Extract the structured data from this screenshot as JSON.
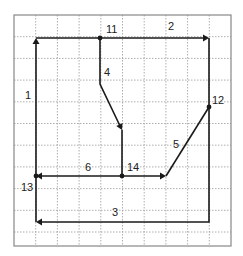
{
  "diagram": {
    "type": "grid-flow-diagram",
    "grid": {
      "x0": 14,
      "y0": 15,
      "x1": 231,
      "y1": 246,
      "columns": 10,
      "cell": 21.7,
      "line_color": "#9a9a9a",
      "border_color": "#888888"
    },
    "stroke_color": "#1a1a1a",
    "nodes": [
      {
        "id": "11",
        "label": "11",
        "x": 100,
        "y": 38,
        "label_x": 106,
        "label_y": 33
      },
      {
        "id": "12",
        "label": "12",
        "x": 209,
        "y": 107,
        "label_x": 212,
        "label_y": 104
      },
      {
        "id": "13",
        "label": "13",
        "x": 36,
        "y": 176,
        "label_x": 21,
        "label_y": 191
      },
      {
        "id": "14",
        "label": "14",
        "x": 122,
        "y": 176,
        "label_x": 127,
        "label_y": 171
      }
    ],
    "edges": [
      {
        "id": "1",
        "label": "1",
        "label_x": 25,
        "label_y": 99,
        "path": "M36,222 L36,40",
        "arrow": {
          "x": 36,
          "y": 38,
          "dir": "up"
        }
      },
      {
        "id": "2",
        "label": "2",
        "label_x": 168,
        "label_y": 30,
        "path": "M36,38 L207,38",
        "arrow": {
          "x": 209,
          "y": 38,
          "dir": "right"
        }
      },
      {
        "id": "3",
        "label": "3",
        "label_x": 112,
        "label_y": 216,
        "path": "M209,38 L209,222 L38,222",
        "arrow": {
          "x": 36,
          "y": 222,
          "dir": "left"
        }
      },
      {
        "id": "4",
        "label": "4",
        "label_x": 104,
        "label_y": 76,
        "path": "M100,38 L100,84 L121,128",
        "arrow": {
          "x": 122,
          "y": 130,
          "dir": "down-right"
        }
      },
      {
        "id": "5",
        "label": "5",
        "label_x": 173,
        "label_y": 148,
        "path": "M166,176 L209,107",
        "arrow": {
          "x": 166,
          "y": 176,
          "dir": "right"
        }
      },
      {
        "id": "6",
        "label": "6",
        "label_x": 85,
        "label_y": 171,
        "path": "M38,176 L164,176",
        "arrow": {
          "x": 36,
          "y": 176,
          "dir": "left"
        }
      },
      {
        "id": "14-up",
        "label": "",
        "path": "M122,130 L122,176",
        "arrow": null
      }
    ]
  }
}
